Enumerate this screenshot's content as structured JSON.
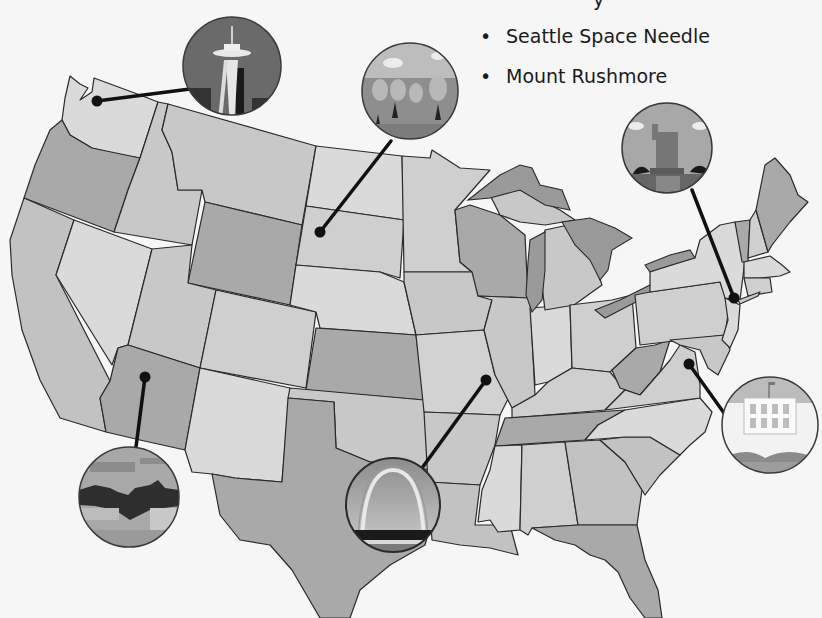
{
  "slide": {
    "partial_text_top": "y",
    "bullets": [
      {
        "label": "Seattle Space Needle"
      },
      {
        "label": "Mount Rushmore"
      }
    ],
    "bullet_glyph": "•"
  },
  "map": {
    "title": "United States landmarks map",
    "colors": {
      "background": "#f6f6f6",
      "state_light": "#d6d6d6",
      "state_mid": "#c2c2c2",
      "state_dark": "#a8a8a8",
      "lake": "#9a9a9a",
      "outline": "#2a2a2a"
    },
    "landmarks": [
      {
        "name": "Seattle Space Needle",
        "state": "Washington",
        "icon": "space-needle-icon"
      },
      {
        "name": "Mount Rushmore",
        "state": "South Dakota",
        "icon": "mount-rushmore-icon"
      },
      {
        "name": "Statue of Liberty",
        "state": "New York",
        "icon": "statue-of-liberty-icon"
      },
      {
        "name": "White House",
        "state": "Washington D.C.",
        "icon": "white-house-icon"
      },
      {
        "name": "Gateway Arch",
        "state": "Missouri",
        "icon": "gateway-arch-icon"
      },
      {
        "name": "Grand Canyon",
        "state": "Arizona",
        "icon": "grand-canyon-icon"
      }
    ]
  }
}
